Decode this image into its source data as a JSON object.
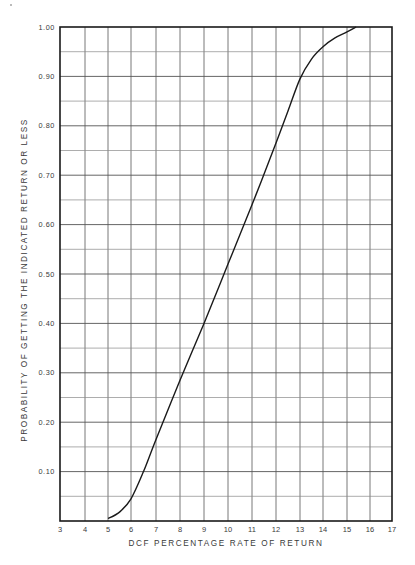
{
  "chart_data": {
    "type": "line",
    "title": "",
    "xlabel": "DCF PERCENTAGE RATE OF RETURN",
    "ylabel": "PROBABILITY OF GETTING THE INDICATED RETURN OR LESS",
    "xlim": [
      3,
      17
    ],
    "ylim": [
      0,
      1.0
    ],
    "grid": true,
    "legend": "none",
    "x_ticks": [
      "3",
      "4",
      "5",
      "6",
      "7",
      "8",
      "9",
      "10",
      "11",
      "12",
      "13",
      "14",
      "15",
      "16",
      "17"
    ],
    "y_ticks": [
      "0.10",
      "0.20",
      "0.30",
      "0.40",
      "0.50",
      "0.60",
      "0.70",
      "0.80",
      "0.90",
      "1.00"
    ],
    "y_minor_step": 0.05,
    "series": [
      {
        "name": "Cumulative probability",
        "x": [
          5.0,
          5.5,
          6.0,
          6.5,
          7.0,
          8.0,
          9.0,
          10.0,
          11.0,
          12.0,
          12.5,
          13.0,
          13.5,
          14.0,
          14.5,
          15.0,
          15.4,
          16.0,
          17.0
        ],
        "y": [
          0.005,
          0.018,
          0.045,
          0.1,
          0.165,
          0.285,
          0.4,
          0.52,
          0.64,
          0.765,
          0.83,
          0.895,
          0.935,
          0.96,
          0.978,
          0.99,
          1.0,
          1.0,
          1.0
        ]
      }
    ]
  },
  "axes": {
    "x_title": "DCF PERCENTAGE RATE OF RETURN",
    "y_title": "PROBABILITY OF GETTING THE INDICATED RETURN OR LESS",
    "y_top_label": "1.00"
  },
  "colors": {
    "line": "#1a1a1a",
    "frame": "#1a1a1a",
    "grid_major": "#555555",
    "grid_minor": "#8a8a8a",
    "text": "#3a3a3a",
    "background": "#ffffff"
  }
}
